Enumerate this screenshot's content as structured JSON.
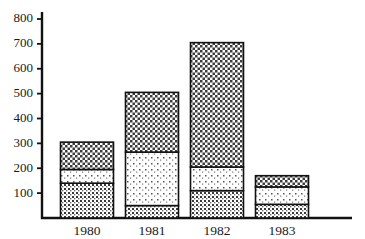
{
  "chart_data": {
    "type": "bar",
    "subtype": "stacked-bar",
    "title": "",
    "xlabel": "",
    "ylabel": "",
    "categories": [
      "1980",
      "1981",
      "1982",
      "1983"
    ],
    "ylim": [
      0,
      800
    ],
    "yticks": [
      100,
      200,
      300,
      400,
      500,
      600,
      700,
      800
    ],
    "ytick_labels": [
      "100",
      "200",
      "300",
      "400",
      "500",
      "600",
      "700",
      "800"
    ],
    "grid": false,
    "legend": "none",
    "series": [
      {
        "name": "bottom",
        "fill": "coarse-dot",
        "values": [
          140,
          50,
          110,
          55
        ]
      },
      {
        "name": "middle",
        "fill": "sparse-dot",
        "values": [
          55,
          215,
          95,
          70
        ]
      },
      {
        "name": "top",
        "fill": "cross-hatch",
        "values": [
          110,
          240,
          500,
          45
        ]
      }
    ],
    "totals": [
      305,
      505,
      705,
      170
    ],
    "cumulative": [
      [
        140,
        195,
        305
      ],
      [
        50,
        265,
        505
      ],
      [
        110,
        205,
        705
      ],
      [
        55,
        125,
        170
      ]
    ],
    "colors": {
      "axis": "#111111",
      "outline": "#111111",
      "background": "#ffffff",
      "pattern_ink": "#2b2b2b"
    }
  },
  "axis": {
    "y_min_label": "",
    "y_max_label": "800"
  }
}
